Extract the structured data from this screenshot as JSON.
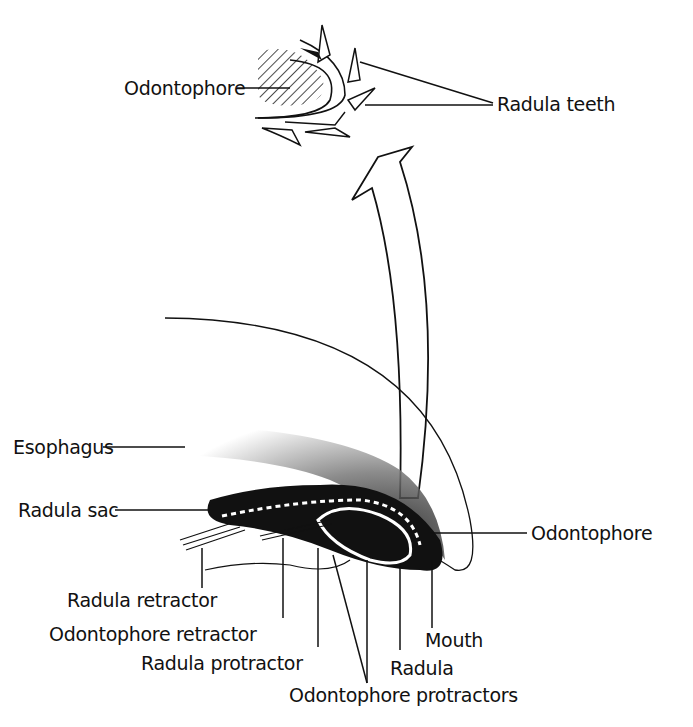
{
  "diagram": {
    "labels": {
      "odontophore_top": "Odontophore",
      "radula_teeth": "Radula teeth",
      "esophagus": "Esophagus",
      "radula_sac": "Radula sac",
      "odontophore_right": "Odontophore",
      "radula_retractor": "Radula retractor",
      "odontophore_retractor": "Odontophore retractor",
      "radula_protractor": "Radula protractor",
      "mouth": "Mouth",
      "radula": "Radula",
      "odontophore_protractors": "Odontophore protractors"
    },
    "colors": {
      "ink": "#111111",
      "background": "#ffffff"
    }
  }
}
